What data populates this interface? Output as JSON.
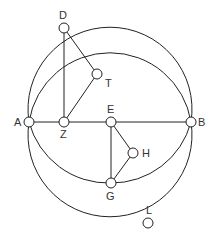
{
  "diagram": {
    "stroke": "#222222",
    "points": {
      "A": {
        "label": "A",
        "x": 29,
        "y": 122,
        "lx": 14,
        "ly": 126
      },
      "B": {
        "label": "B",
        "x": 191,
        "y": 122,
        "lx": 198,
        "ly": 126
      },
      "D": {
        "label": "D",
        "x": 64,
        "y": 28,
        "lx": 59,
        "ly": 19
      },
      "T": {
        "label": "T",
        "x": 97,
        "y": 74,
        "lx": 105,
        "ly": 87
      },
      "Z": {
        "label": "Z",
        "x": 64,
        "y": 122,
        "lx": 60,
        "ly": 138
      },
      "E": {
        "label": "E",
        "x": 111,
        "y": 122,
        "lx": 107,
        "ly": 113
      },
      "H": {
        "label": "H",
        "x": 133,
        "y": 153,
        "lx": 142,
        "ly": 157
      },
      "G": {
        "label": "G",
        "x": 111,
        "y": 183,
        "lx": 106,
        "ly": 200
      },
      "L": {
        "label": "L",
        "x": 148,
        "y": 223,
        "lx": 146,
        "ly": 214
      }
    }
  }
}
